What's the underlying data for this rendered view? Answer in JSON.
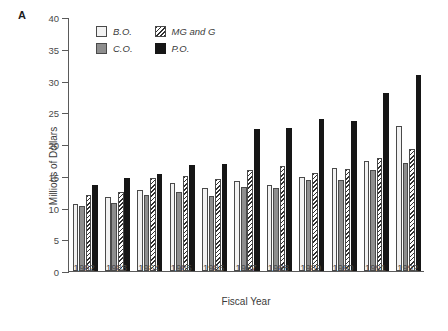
{
  "figure": {
    "panel_letter": "A"
  },
  "chart_data": {
    "type": "bar",
    "title": "",
    "subtitle": "",
    "xlabel": "Fiscal Year",
    "ylabel": "Millions of Dollars",
    "ylim": [
      0,
      40
    ],
    "ytick_step": 5,
    "yticks": [
      0,
      5,
      10,
      15,
      20,
      25,
      30,
      35,
      40
    ],
    "ytick_labels": [
      "0",
      "5",
      "10",
      "15",
      "20",
      "25",
      "30",
      "35",
      "40"
    ],
    "grid": false,
    "legend_position": "top-left-inside",
    "categories": [
      "1982",
      "1983",
      "1984",
      "1985",
      "1986",
      "1987",
      "1988",
      "1989",
      "1990",
      "1991",
      "1992"
    ],
    "series": [
      {
        "name": "B.O.",
        "fill": "light-gray",
        "color": "#f2f2f2",
        "values": [
          10.5,
          11.7,
          12.8,
          13.8,
          13.1,
          14.2,
          13.5,
          14.8,
          16.3,
          17.3,
          22.8
        ]
      },
      {
        "name": "C.O.",
        "fill": "medium-gray",
        "color": "#8e8e8e",
        "values": [
          10.2,
          10.7,
          12.0,
          12.4,
          11.8,
          13.2,
          13.0,
          14.4,
          14.3,
          15.9,
          17.0
        ]
      },
      {
        "name": "MG and G",
        "fill": "diagonal-hatch",
        "color": "#2f2f2f",
        "values": [
          12.0,
          12.5,
          14.6,
          15.0,
          14.5,
          15.9,
          16.5,
          15.4,
          16.0,
          17.8,
          19.2
        ]
      },
      {
        "name": "P.O.",
        "fill": "black",
        "color": "#161616",
        "values": [
          13.5,
          14.6,
          15.3,
          16.7,
          16.9,
          22.3,
          22.5,
          23.9,
          23.7,
          28.1,
          30.8
        ]
      }
    ]
  }
}
